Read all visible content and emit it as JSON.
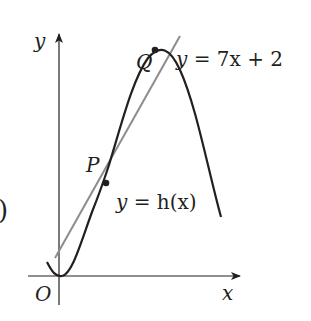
{
  "diagram": {
    "axes": {
      "x_label": "x",
      "y_label": "y",
      "origin_label": "O"
    },
    "points": {
      "P": "P",
      "Q": "Q"
    },
    "line": {
      "equation_lhs": "y",
      "equation_rhs": " = 7x + 2",
      "color": "#8c8c8c"
    },
    "curve": {
      "equation_lhs": "y",
      "equation_rhs": " = h(x)",
      "color": "#231f20"
    },
    "left_edge_fragment": ")"
  }
}
